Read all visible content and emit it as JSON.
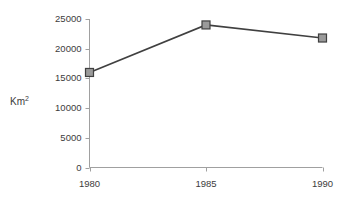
{
  "chart_data": {
    "type": "line",
    "title": "",
    "subtitle": "",
    "xlabel": "",
    "ylabel": "Km2",
    "ylabel_base": "Km",
    "ylabel_sup": "2",
    "x": [
      1980,
      1985,
      1990
    ],
    "categories": [
      "1980",
      "1985",
      "1990"
    ],
    "values": [
      16000,
      24000,
      21800
    ],
    "series": [
      {
        "name": "Area",
        "values": [
          16000,
          24000,
          21800
        ]
      }
    ],
    "xlim": [
      1980,
      1990
    ],
    "ylim": [
      0,
      25000
    ],
    "yticks": [
      0,
      5000,
      10000,
      15000,
      20000,
      25000
    ],
    "ytick_labels": [
      "0",
      "5000",
      "10000",
      "15000",
      "20000",
      "25000"
    ],
    "xticks": [
      1980,
      1985,
      1990
    ],
    "xtick_labels": [
      "1980",
      "1985",
      "1990"
    ],
    "grid": false,
    "legend": false,
    "legend_position": "none",
    "marker": "square",
    "colors": {
      "line": "#404040",
      "marker_fill": "#9a9a9a",
      "marker_edge": "#404040",
      "axis": "#a0a0a0",
      "text": "#3c3c3c",
      "background": "#ffffff"
    }
  }
}
